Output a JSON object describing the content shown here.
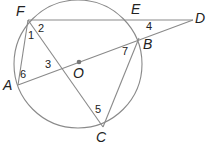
{
  "diagram": {
    "type": "circle-geometry",
    "circle": {
      "center_label": "O",
      "cx": 78,
      "cy": 64,
      "r": 64
    },
    "points": [
      {
        "id": "F",
        "label": "F",
        "x": 28,
        "y": 20,
        "lx": 16,
        "ly": 16
      },
      {
        "id": "E",
        "label": "E",
        "x": 140,
        "y": 20,
        "lx": 131,
        "ly": 14
      },
      {
        "id": "D",
        "label": "D",
        "x": 193,
        "y": 20,
        "lx": 195,
        "ly": 23
      },
      {
        "id": "B",
        "label": "B",
        "x": 139,
        "y": 38,
        "lx": 143,
        "ly": 49
      },
      {
        "id": "A",
        "label": "A",
        "x": 18,
        "y": 85,
        "lx": 3,
        "ly": 90
      },
      {
        "id": "C",
        "label": "C",
        "x": 103,
        "y": 127,
        "lx": 96,
        "ly": 142
      },
      {
        "id": "O",
        "label": "O",
        "x": 79,
        "y": 62,
        "lx": 73,
        "ly": 78
      }
    ],
    "segments": [
      {
        "from": "F",
        "to": "D"
      },
      {
        "from": "A",
        "to": "D"
      },
      {
        "from": "F",
        "to": "C"
      },
      {
        "from": "F",
        "to": "A"
      },
      {
        "from": "B",
        "to": "C"
      }
    ],
    "angle_labels": [
      {
        "label": "1",
        "x": 28,
        "y": 39
      },
      {
        "label": "2",
        "x": 38,
        "y": 32
      },
      {
        "label": "3",
        "x": 45,
        "y": 68
      },
      {
        "label": "4",
        "x": 146,
        "y": 30
      },
      {
        "label": "5",
        "x": 95,
        "y": 113
      },
      {
        "label": "6",
        "x": 20,
        "y": 78
      },
      {
        "label": "7",
        "x": 122,
        "y": 55
      }
    ],
    "colors": {
      "line": "#8a8a8a",
      "text": "#222222",
      "center_dot": "#777777"
    }
  }
}
